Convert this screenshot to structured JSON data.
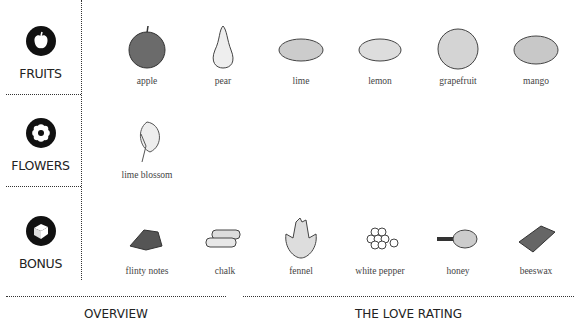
{
  "categories": [
    {
      "id": "fruits",
      "label": "FRUITS",
      "icon": "apple-icon"
    },
    {
      "id": "flowers",
      "label": "FLOWERS",
      "icon": "flower-icon"
    },
    {
      "id": "bonus",
      "label": "BONUS",
      "icon": "box-icon"
    }
  ],
  "fruits": [
    {
      "name": "apple"
    },
    {
      "name": "pear"
    },
    {
      "name": "lime"
    },
    {
      "name": "lemon"
    },
    {
      "name": "grapefruit"
    },
    {
      "name": "mango"
    }
  ],
  "flowers": [
    {
      "name": "lime blossom"
    }
  ],
  "bonus": [
    {
      "name": "flinty notes"
    },
    {
      "name": "chalk"
    },
    {
      "name": "fennel"
    },
    {
      "name": "white pepper"
    },
    {
      "name": "honey"
    },
    {
      "name": "beeswax"
    }
  ],
  "footer": {
    "overview": "OVERVIEW",
    "love_rating": "THE LOVE RATING"
  }
}
